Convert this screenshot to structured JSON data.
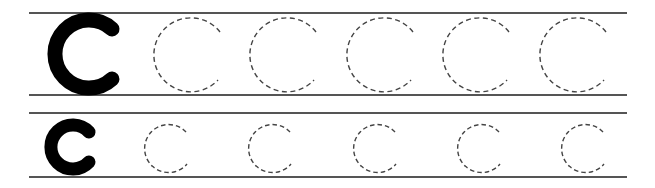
{
  "worksheet": {
    "letter_upper": "C",
    "letter_lower": "c",
    "line_color": "#555555",
    "solid_color": "#000000",
    "dash_color": "#444444",
    "rows": [
      {
        "name": "uppercase-row",
        "model_letter": "C",
        "trace_count": 5,
        "top_line_y": 13,
        "bottom_line_y": 95
      },
      {
        "name": "lowercase-row",
        "model_letter": "c",
        "trace_count": 5,
        "top_line_y": 113,
        "bottom_line_y": 177
      }
    ]
  }
}
